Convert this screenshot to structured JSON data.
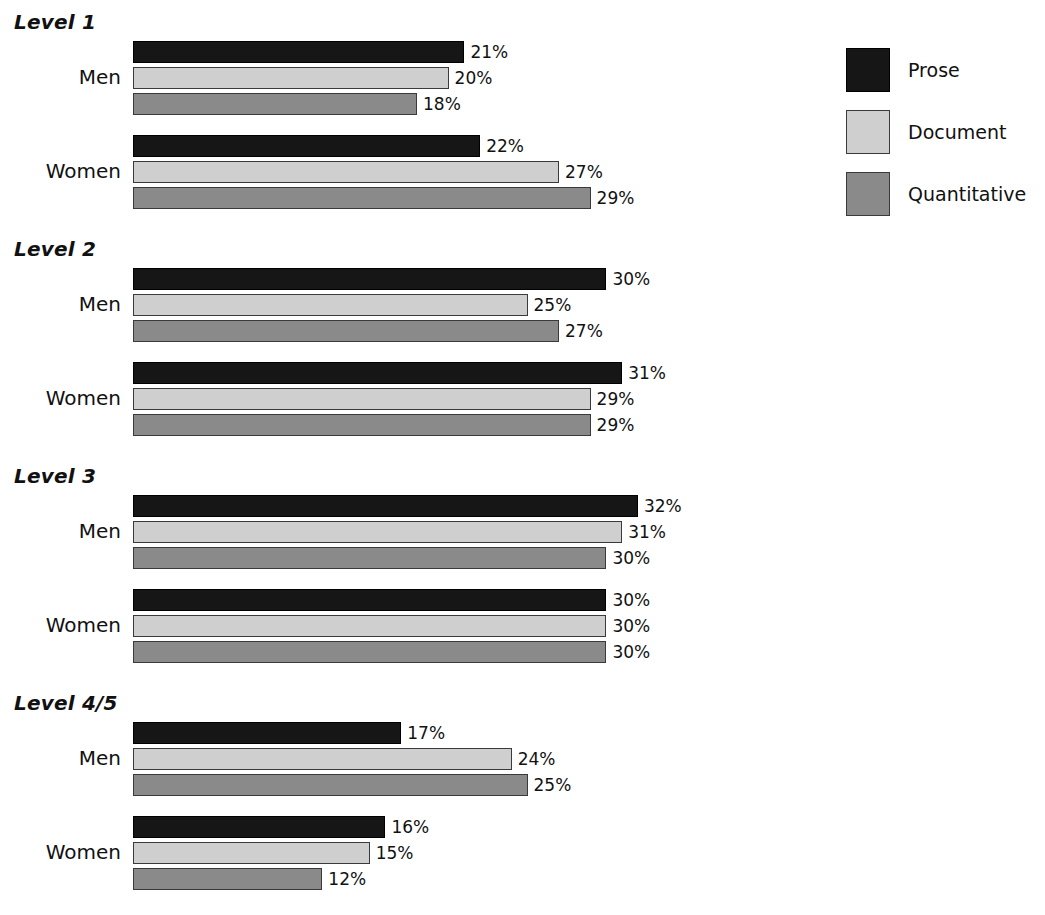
{
  "chart_data": {
    "type": "bar",
    "orientation": "horizontal",
    "title": "",
    "xlabel": "",
    "ylabel": "",
    "grid": false,
    "axis_visible": false,
    "xlim": [
      0,
      35
    ],
    "value_suffix": "%",
    "legend_position": "right",
    "series": [
      {
        "name": "Prose",
        "color": "#161616"
      },
      {
        "name": "Document",
        "color": "#cfcfcf"
      },
      {
        "name": "Quantitative",
        "color": "#8a8a8a"
      }
    ],
    "levels": [
      {
        "label": "Level 1",
        "groups": [
          {
            "label": "Men",
            "bars": [
              {
                "series": "Prose",
                "value": 21,
                "value_label": "21%"
              },
              {
                "series": "Document",
                "value": 20,
                "value_label": "20%"
              },
              {
                "series": "Quantitative",
                "value": 18,
                "value_label": "18%"
              }
            ]
          },
          {
            "label": "Women",
            "bars": [
              {
                "series": "Prose",
                "value": 22,
                "value_label": "22%"
              },
              {
                "series": "Document",
                "value": 27,
                "value_label": "27%"
              },
              {
                "series": "Quantitative",
                "value": 29,
                "value_label": "29%"
              }
            ]
          }
        ]
      },
      {
        "label": "Level 2",
        "groups": [
          {
            "label": "Men",
            "bars": [
              {
                "series": "Prose",
                "value": 30,
                "value_label": "30%"
              },
              {
                "series": "Document",
                "value": 25,
                "value_label": "25%"
              },
              {
                "series": "Quantitative",
                "value": 27,
                "value_label": "27%"
              }
            ]
          },
          {
            "label": "Women",
            "bars": [
              {
                "series": "Prose",
                "value": 31,
                "value_label": "31%"
              },
              {
                "series": "Document",
                "value": 29,
                "value_label": "29%"
              },
              {
                "series": "Quantitative",
                "value": 29,
                "value_label": "29%"
              }
            ]
          }
        ]
      },
      {
        "label": "Level 3",
        "groups": [
          {
            "label": "Men",
            "bars": [
              {
                "series": "Prose",
                "value": 32,
                "value_label": "32%"
              },
              {
                "series": "Document",
                "value": 31,
                "value_label": "31%"
              },
              {
                "series": "Quantitative",
                "value": 30,
                "value_label": "30%"
              }
            ]
          },
          {
            "label": "Women",
            "bars": [
              {
                "series": "Prose",
                "value": 30,
                "value_label": "30%"
              },
              {
                "series": "Document",
                "value": 30,
                "value_label": "30%"
              },
              {
                "series": "Quantitative",
                "value": 30,
                "value_label": "30%"
              }
            ]
          }
        ]
      },
      {
        "label": "Level 4/5",
        "groups": [
          {
            "label": "Men",
            "bars": [
              {
                "series": "Prose",
                "value": 17,
                "value_label": "17%"
              },
              {
                "series": "Document",
                "value": 24,
                "value_label": "24%"
              },
              {
                "series": "Quantitative",
                "value": 25,
                "value_label": "25%"
              }
            ]
          },
          {
            "label": "Women",
            "bars": [
              {
                "series": "Prose",
                "value": 16,
                "value_label": "16%"
              },
              {
                "series": "Document",
                "value": 15,
                "value_label": "15%"
              },
              {
                "series": "Quantitative",
                "value": 12,
                "value_label": "12%"
              }
            ]
          }
        ]
      }
    ]
  },
  "legend": {
    "items": [
      {
        "label": "Prose",
        "swatch": "prose"
      },
      {
        "label": "Document",
        "swatch": "document"
      },
      {
        "label": "Quantitative",
        "swatch": "quantitative"
      }
    ]
  },
  "layout": {
    "bar_origin_x": 133,
    "px_per_unit": 15.78,
    "bar_height": 22,
    "bar_gap": 4,
    "group_gap": 20,
    "level_gap": 16,
    "first_heading_y": 10,
    "legend_item_spacing": 62
  }
}
